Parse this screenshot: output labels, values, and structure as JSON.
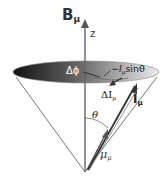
{
  "diagram": {
    "type": "precession-cone",
    "labels": {
      "field": "B",
      "field_sub": "μ",
      "axis": "z",
      "delta_phi": "Δϕ",
      "perp_component_I": "I",
      "perp_component_sub": "μ",
      "perp_component_tail": "sinθ",
      "delta_I": "ΔI",
      "delta_I_sub": "μ",
      "I_vec": "I",
      "I_vec_sub": "μ",
      "theta": "θ",
      "mu": "μ",
      "mu_sub": "μ"
    },
    "colors": {
      "disk_dark": "#1a1a1a",
      "disk_light": "#e6e6e6",
      "lines": "#444444",
      "axis": "#555555",
      "label_light": "#ffffff",
      "label_dark": "#222222"
    }
  }
}
